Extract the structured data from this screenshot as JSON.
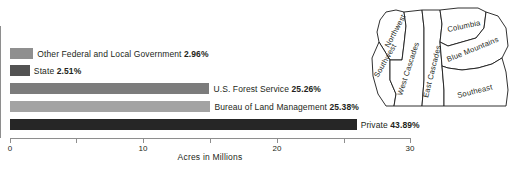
{
  "chart_data": {
    "type": "bar",
    "orientation": "horizontal",
    "title": "",
    "xlabel": "Acres in Millions",
    "ylabel": "",
    "xlim": [
      0,
      30
    ],
    "xticks": [
      0,
      10,
      20,
      30
    ],
    "xtick_labels": [
      "0",
      "10",
      "20",
      "30"
    ],
    "grid": false,
    "legend": false,
    "categories": [
      "Other Federal and Local Government",
      "State",
      "U.S. Forest Service",
      "Bureau of Land Management",
      "Private"
    ],
    "percent_labels": [
      "2.96%",
      "2.51%",
      "25.26%",
      "25.38%",
      "43.89%"
    ],
    "percent_values": [
      2.96,
      2.51,
      25.26,
      25.38,
      43.89
    ],
    "values": [
      1.75,
      1.49,
      14.96,
      15.03,
      26.0
    ],
    "bar_colors": [
      "#8f8f8f",
      "#535353",
      "#7c7c7c",
      "#a3a3a3",
      "#262626"
    ],
    "bars": [
      {
        "label": "Other Federal and Local Government",
        "percent": "2.96%",
        "value": 1.75,
        "color": "#8f8f8f"
      },
      {
        "label": "State",
        "percent": "2.51%",
        "value": 1.49,
        "color": "#535353"
      },
      {
        "label": "U.S. Forest Service",
        "percent": "25.26%",
        "value": 14.96,
        "color": "#7c7c7c"
      },
      {
        "label": "Bureau of Land Management",
        "percent": "25.38%",
        "value": 15.03,
        "color": "#a3a3a3"
      },
      {
        "label": "Private",
        "percent": "43.89%",
        "value": 26.0,
        "color": "#262626"
      }
    ]
  },
  "map": {
    "name": "oregon-regions-map",
    "title": "",
    "regions": [
      {
        "id": "northwest",
        "label": "Northwest"
      },
      {
        "id": "west-cascades",
        "label": "West Cascades"
      },
      {
        "id": "east-cascades",
        "label": "East Cascades"
      },
      {
        "id": "columbia",
        "label": "Columbia"
      },
      {
        "id": "blue-mountains",
        "label": "Blue Mountains"
      },
      {
        "id": "southeast",
        "label": "Southeast"
      },
      {
        "id": "southwest",
        "label": "Southwest"
      }
    ]
  },
  "colors": {
    "axis": "#8e8e8e",
    "text": "#231f20",
    "map_stroke": "#1a1a1a",
    "map_fill": "#ffffff",
    "background": "#ffffff"
  }
}
